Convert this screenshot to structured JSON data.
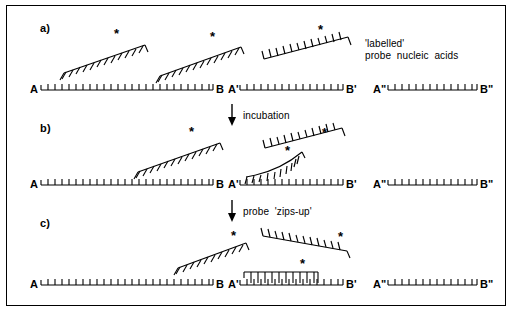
{
  "figure": {
    "background_color": "#ffffff",
    "line_color": "#000000",
    "border_color": "#000000"
  },
  "panels": [
    {
      "id": "a",
      "label": "a)"
    },
    {
      "id": "b",
      "label": "b)"
    },
    {
      "id": "c",
      "label": "c)"
    }
  ],
  "caption": {
    "line1": "'labelled'",
    "line2": "probe  nucleic  acids"
  },
  "steps": [
    {
      "id": "incubation",
      "label": "incubation",
      "arrow": "down-arrow-icon"
    },
    {
      "id": "zips-up",
      "label": "probe  'zips-up'",
      "arrow": "down-arrow-icon"
    }
  ],
  "target_strands": {
    "row_a": [
      {
        "left_label": "A",
        "right_label": "B"
      },
      {
        "left_label": "A'",
        "right_label": "B'"
      },
      {
        "left_label": "A\"",
        "right_label": "B\""
      }
    ],
    "row_b": [
      {
        "left_label": "A",
        "right_label": "B"
      },
      {
        "left_label": "A'",
        "right_label": "B'"
      },
      {
        "left_label": "A\"",
        "right_label": "B\""
      }
    ],
    "row_c": [
      {
        "left_label": "A",
        "right_label": "B"
      },
      {
        "left_label": "A'",
        "right_label": "B'"
      },
      {
        "left_label": "A\"",
        "right_label": "B\""
      }
    ]
  },
  "probes": {
    "row_a": [
      {
        "id": "probe-a-1",
        "marker": "*"
      },
      {
        "id": "probe-a-2",
        "marker": "*"
      },
      {
        "id": "probe-a-3",
        "marker": "*"
      }
    ],
    "row_b": [
      {
        "id": "probe-b-1",
        "marker": "*"
      },
      {
        "id": "probe-b-2",
        "marker": "*"
      },
      {
        "id": "probe-b-3",
        "marker": "*"
      }
    ],
    "row_c": [
      {
        "id": "probe-c-1",
        "marker": "*"
      },
      {
        "id": "probe-c-2",
        "marker": "*"
      },
      {
        "id": "probe-c-hybridized",
        "marker": "*"
      }
    ]
  },
  "markers": {
    "label_star": "*"
  }
}
